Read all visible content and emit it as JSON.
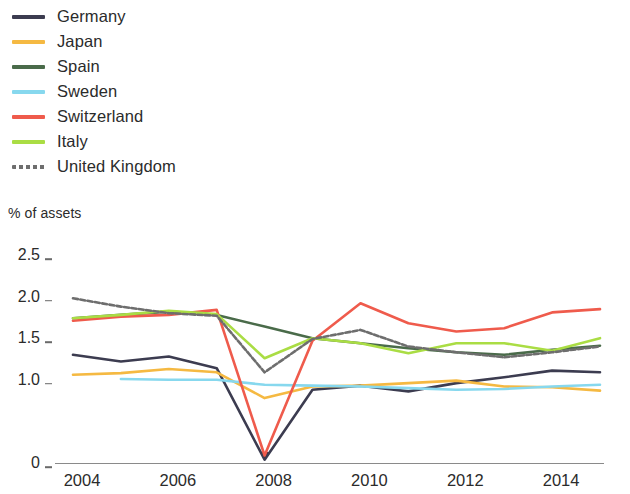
{
  "legend": {
    "items": [
      {
        "label": "Germany",
        "color": "#3c3c50",
        "style": "solid"
      },
      {
        "label": "Japan",
        "color": "#f5b942",
        "style": "solid"
      },
      {
        "label": "Spain",
        "color": "#4a6b4a",
        "style": "solid"
      },
      {
        "label": "Sweden",
        "color": "#87d8ee",
        "style": "solid"
      },
      {
        "label": "Switzerland",
        "color": "#ef5b4c",
        "style": "solid"
      },
      {
        "label": "Italy",
        "color": "#aadd44",
        "style": "solid"
      },
      {
        "label": "United Kingdom",
        "color": "#6e6e6e",
        "style": "dashed"
      }
    ]
  },
  "axis_caption": "% of assets",
  "chart_data": {
    "type": "line",
    "title": "",
    "subtitle": "",
    "xlabel": "",
    "ylabel": "% of assets",
    "ylim": [
      0,
      2.5
    ],
    "xlim": [
      2004,
      2015
    ],
    "grid": false,
    "legend_position": "top-left",
    "y_ticks": [
      0,
      1.0,
      1.5,
      2.0,
      2.5
    ],
    "y_tick_labels": [
      "0",
      "1.0",
      "1.5",
      "2.0",
      "2.5"
    ],
    "x_ticks": [
      2004,
      2006,
      2008,
      2010,
      2012,
      2014
    ],
    "x_tick_labels": [
      "2004",
      "2006",
      "2008",
      "2010",
      "2012",
      "2014"
    ],
    "x": [
      2004,
      2005,
      2006,
      2007,
      2008,
      2009,
      2010,
      2011,
      2012,
      2013,
      2014,
      2015
    ],
    "series": [
      {
        "name": "Germany",
        "color": "#3c3c50",
        "style": "solid",
        "values": [
          1.3,
          1.22,
          1.28,
          1.14,
          0.04,
          0.88,
          0.93,
          0.86,
          0.96,
          1.03,
          1.11,
          1.09
        ]
      },
      {
        "name": "Japan",
        "color": "#f5b942",
        "style": "solid",
        "values": [
          1.06,
          1.08,
          1.13,
          1.09,
          0.78,
          0.92,
          0.93,
          0.96,
          0.99,
          0.92,
          0.91,
          0.87
        ]
      },
      {
        "name": "Spain",
        "color": "#4a6b4a",
        "style": "solid",
        "values": [
          1.74,
          1.78,
          1.82,
          1.78,
          1.64,
          1.5,
          1.44,
          1.38,
          1.33,
          1.3,
          1.36,
          1.41
        ]
      },
      {
        "name": "Sweden",
        "color": "#87d8ee",
        "style": "solid",
        "values": [
          null,
          1.01,
          1.0,
          1.0,
          0.94,
          0.93,
          0.92,
          0.9,
          0.88,
          0.89,
          0.92,
          0.94
        ]
      },
      {
        "name": "Switzerland",
        "color": "#ef5b4c",
        "style": "solid",
        "values": [
          1.71,
          1.76,
          1.78,
          1.84,
          0.09,
          1.47,
          1.92,
          1.68,
          1.58,
          1.62,
          1.81,
          1.85
        ]
      },
      {
        "name": "Italy",
        "color": "#aadd44",
        "style": "solid",
        "values": [
          1.74,
          1.78,
          1.83,
          1.79,
          1.26,
          1.5,
          1.44,
          1.32,
          1.44,
          1.44,
          1.35,
          1.5
        ]
      },
      {
        "name": "United Kingdom",
        "color": "#6e6e6e",
        "style": "dashed",
        "values": [
          1.98,
          1.88,
          1.8,
          1.77,
          1.09,
          1.49,
          1.6,
          1.4,
          1.33,
          1.27,
          1.33,
          1.4
        ]
      }
    ]
  }
}
